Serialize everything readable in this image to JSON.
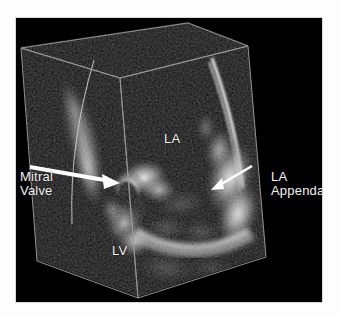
{
  "figure": {
    "modality": "3D echocardiography volume rendering",
    "background_color": "#ffffff",
    "scan_background_color": "#000000",
    "label_color": "#f2f2f2",
    "wireframe_color": "#9a9a9a",
    "arrow_color": "#ffffff"
  },
  "labels": {
    "mitral_valve": "Mitral\nValve",
    "left_atrium": "LA",
    "la_appendage": "LA\nAppendage",
    "left_ventricle": "LV"
  },
  "annotations": {
    "arrows": [
      {
        "name": "mitral-valve-arrow",
        "from": [
          30,
          167
        ],
        "to": [
          110,
          181
        ],
        "direction": "right"
      },
      {
        "name": "la-appendage-arrow",
        "from": [
          252,
          166
        ],
        "to": [
          213,
          186
        ],
        "direction": "left"
      }
    ]
  },
  "volume_box": {
    "description": "3D pyramidal acquisition volume wireframe",
    "vertices": {
      "top_back_left": [
        21,
        48
      ],
      "top_back_apex": [
        188,
        23
      ],
      "top_front_right": [
        248,
        46
      ],
      "top_front_center": [
        120,
        78
      ],
      "bottom_front_left": [
        37,
        261
      ],
      "bottom_front_center": [
        138,
        298
      ],
      "bottom_front_right": [
        266,
        257
      ]
    }
  }
}
